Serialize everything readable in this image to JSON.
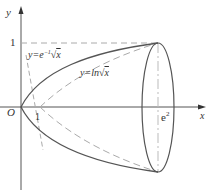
{
  "diagram": {
    "axes": {
      "x_label": "x",
      "y_label": "y",
      "origin_label": "O"
    },
    "ticks": {
      "x_one": "1",
      "x_e2": "e",
      "x_e2_exp": "2",
      "y_one": "1"
    },
    "curves": [
      {
        "name": "y=e^-1 sqrt(x)",
        "label_prefix": "y=e",
        "label_exp": "−1",
        "label_root": "x",
        "style": "solid"
      },
      {
        "name": "y=ln sqrt(x)",
        "label_prefix": "y=ln",
        "label_root": "x",
        "style": "dashed"
      }
    ],
    "colors": {
      "curve": "#555555",
      "dashed": "#aaaaaa",
      "axis": "#444444"
    }
  }
}
